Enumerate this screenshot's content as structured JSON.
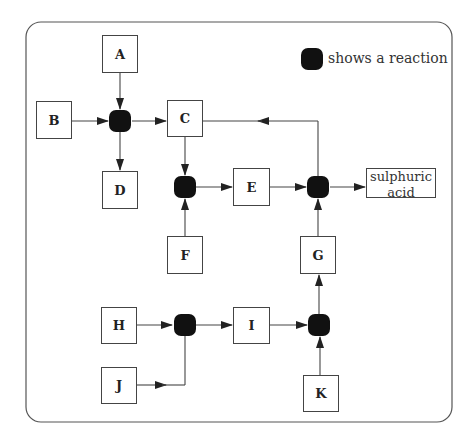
{
  "diagram": {
    "legend": {
      "symbol": "reaction-node",
      "label": "shows a reaction"
    },
    "substances": {
      "A": "A",
      "B": "B",
      "C": "C",
      "D": "D",
      "E": "E",
      "F": "F",
      "G": "G",
      "H": "H",
      "I": "I",
      "J": "J",
      "K": "K"
    },
    "product": {
      "line1": "sulphuric",
      "line2": "acid"
    },
    "reactions": [
      {
        "id": "R1",
        "inputs": [
          "A",
          "B"
        ],
        "outputs": [
          "C",
          "D"
        ]
      },
      {
        "id": "R2",
        "inputs": [
          "C",
          "F"
        ],
        "outputs": [
          "E"
        ]
      },
      {
        "id": "R3",
        "inputs": [
          "E",
          "G"
        ],
        "outputs": [
          "sulphuric acid",
          "C"
        ]
      },
      {
        "id": "R4",
        "inputs": [
          "H",
          "J"
        ],
        "outputs": [
          "I"
        ]
      },
      {
        "id": "R5",
        "inputs": [
          "I",
          "K"
        ],
        "outputs": [
          "G"
        ]
      }
    ],
    "colors": {
      "line": "#444444",
      "reaction": "#111111",
      "background": "#ffffff"
    }
  }
}
